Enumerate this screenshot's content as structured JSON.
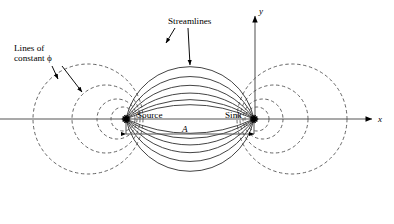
{
  "figure": {
    "background_color": "#ffffff",
    "stroke_color": "#3a3a3a",
    "axis_color": "#555555",
    "marker_color": "#000000"
  },
  "axes": {
    "x_label": "x",
    "y_label": "y",
    "origin_px": {
      "x": 255,
      "y": 119
    },
    "x_axis_start_px": 0,
    "x_axis_end_px": 372,
    "y_axis_top_px": 16
  },
  "points": [
    {
      "name": "source",
      "label": "Source",
      "x_px": 126,
      "y_px": 119,
      "label_x_px": 137,
      "label_y_px": 110
    },
    {
      "name": "sink",
      "label": "Sink",
      "x_px": 254,
      "y_px": 119,
      "label_x_px": 225,
      "label_y_px": 110
    }
  ],
  "annotations": [
    {
      "name": "lines-of-constant-phi",
      "line1": "Lines of",
      "line2": "constant ϕ",
      "x_px": 14,
      "y_px": 43,
      "leaders": [
        {
          "x1": 52,
          "y1": 66,
          "x2": 58,
          "y2": 79
        },
        {
          "x1": 62,
          "y1": 66,
          "x2": 82,
          "y2": 92
        }
      ]
    },
    {
      "name": "streamlines",
      "line1": "Streamlines",
      "line2": "",
      "x_px": 168,
      "y_px": 16,
      "leaders": [
        {
          "x1": 175,
          "y1": 28,
          "x2": 166,
          "y2": 43
        },
        {
          "x1": 188,
          "y1": 28,
          "x2": 190,
          "y2": 65
        }
      ]
    }
  ],
  "dimension": {
    "name": "separation-A",
    "label": "A",
    "label_x_px": 182,
    "label_y_px": 124,
    "line_y_px": 134,
    "x_start_px": 126,
    "x_end_px": 254,
    "tick_top_px": 119
  },
  "chart_data": {
    "type": "diagram",
    "source_px": {
      "x": 126,
      "y": 119
    },
    "sink_px": {
      "x": 254,
      "y": 119
    },
    "half_separation_px": 64,
    "streamline_offsets_px": [
      13,
      27,
      44,
      66,
      96,
      136
    ],
    "equipotential_circles_px": [
      {
        "cx": 88,
        "r": 55
      },
      {
        "cx": 106,
        "r": 34
      },
      {
        "cx": 117,
        "r": 20
      },
      {
        "cx": 123,
        "r": 12
      },
      {
        "cx": 292,
        "r": 55
      },
      {
        "cx": 274,
        "r": 34
      },
      {
        "cx": 263,
        "r": 20
      },
      {
        "cx": 257,
        "r": 12
      }
    ]
  }
}
